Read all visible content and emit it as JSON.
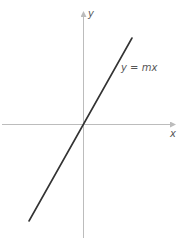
{
  "diagram": {
    "type": "coordinate-graph",
    "axes": {
      "x_label": "x",
      "y_label": "y",
      "color": "#bcbcbc"
    },
    "line": {
      "label": "y = mx",
      "label_parts": [
        "y",
        " = ",
        "mx"
      ],
      "color": "#333333",
      "through_origin": true,
      "slope_sign": "positive"
    }
  }
}
